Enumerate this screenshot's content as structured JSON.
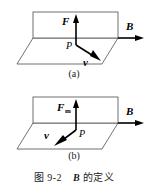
{
  "figure": {
    "caption_number": "图 9-2",
    "caption_symbol": "B",
    "caption_text": "的定义",
    "panels": [
      {
        "id": "a",
        "label": "(a)",
        "point_label": "P",
        "vectors": [
          {
            "name": "force",
            "label": "F",
            "subscript": "",
            "direction": "up"
          },
          {
            "name": "velocity",
            "label": "v",
            "subscript": "",
            "direction": "down-right"
          },
          {
            "name": "magnetic-field",
            "label": "B",
            "subscript": "",
            "direction": "right"
          }
        ]
      },
      {
        "id": "b",
        "label": "(b)",
        "point_label": "P",
        "vectors": [
          {
            "name": "magnetic-force",
            "label": "F",
            "subscript": "m",
            "direction": "up"
          },
          {
            "name": "velocity",
            "label": "v",
            "subscript": "",
            "direction": "down-left"
          },
          {
            "name": "magnetic-field",
            "label": "B",
            "subscript": "",
            "direction": "right"
          }
        ]
      }
    ],
    "colors": {
      "ink": "#000000",
      "plane_outline": "#4d4d4d",
      "background": "#ffffff"
    }
  }
}
